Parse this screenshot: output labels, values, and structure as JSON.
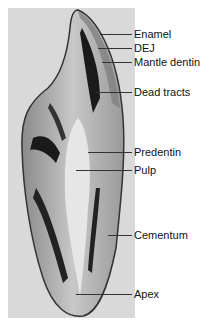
{
  "figure": {
    "labels": [
      {
        "id": "enamel",
        "text": "Enamel",
        "y": 34,
        "x0": 100
      },
      {
        "id": "dej",
        "text": "DEJ",
        "y": 48,
        "x0": 98
      },
      {
        "id": "mantle-dentin",
        "text": "Mantle dentin",
        "y": 62,
        "x0": 102
      },
      {
        "id": "dead-tracts",
        "text": "Dead tracts",
        "y": 92,
        "x0": 96
      },
      {
        "id": "predentin",
        "text": "Predentin",
        "y": 152,
        "x0": 88
      },
      {
        "id": "pulp",
        "text": "Pulp",
        "y": 170,
        "x0": 76
      },
      {
        "id": "cementum",
        "text": "Cementum",
        "y": 235,
        "x0": 108
      },
      {
        "id": "apex",
        "text": "Apex",
        "y": 294,
        "x0": 76
      }
    ]
  }
}
